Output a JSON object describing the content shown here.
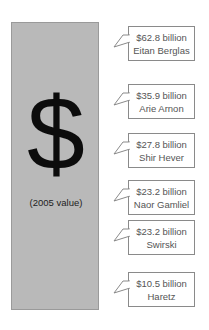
{
  "figure": {
    "center_symbol": "$",
    "center_note": "(2005 value)",
    "bar_color": "#b9b9b9"
  },
  "callouts": [
    {
      "value": "$62.8 billion",
      "source": "Eitan Berglas",
      "top": 26
    },
    {
      "value": "$35.9 billion",
      "source": "Arie Arnon",
      "top": 84
    },
    {
      "value": "$27.8 billion",
      "source": "Shir Hever",
      "top": 133
    },
    {
      "value": "$23.2 billion",
      "source": "Naor Gamliel",
      "top": 180
    },
    {
      "value": "$23.2 billion",
      "source": "Swirski",
      "top": 220
    },
    {
      "value": "$10.5 billion",
      "source": "Haretz",
      "top": 272
    }
  ]
}
